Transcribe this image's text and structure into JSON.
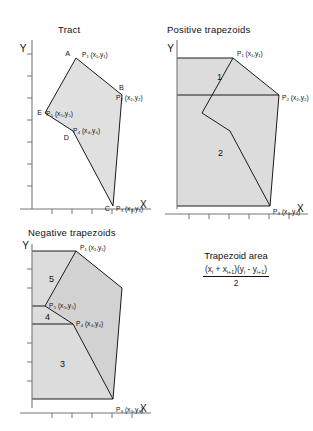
{
  "figure": {
    "background_color": "#ffffff",
    "line_color": "#1a1a1a",
    "fill_light": "#e3e3e3",
    "fill_mid": "#d8d8d8"
  },
  "panels": {
    "tract": {
      "title": "Tract",
      "axis_y": "Y",
      "axis_x": "X",
      "vertices": [
        {
          "letter": "A",
          "label": "P",
          "sub": "1",
          "coords": "(x₁,y₁)"
        },
        {
          "letter": "B",
          "label": "P",
          "sub": "2",
          "coords": "(x₂,y₂)"
        },
        {
          "letter": "C",
          "label": "P",
          "sub": "3",
          "coords": "(x₃,y₃)"
        },
        {
          "letter": "D",
          "label": "P",
          "sub": "4",
          "coords": "(x₄,y₄)"
        },
        {
          "letter": "E",
          "label": "P",
          "sub": "5",
          "coords": "(x₅,y₅)"
        }
      ],
      "point_labels": {
        "p1": "P₁ (x₁,y₁)",
        "p2": "P₂ (x₂,y₂)",
        "p3": "P₃ (x₃,y₃)",
        "p4": "P₄ (x₄,y₄)",
        "p5": "P₅ (x₅,y₅)"
      },
      "corner_letters": {
        "a": "A",
        "b": "B",
        "c": "C",
        "d": "D",
        "e": "E"
      }
    },
    "positive": {
      "title": "Positive trapezoids",
      "axis_y": "Y",
      "axis_x": "X",
      "region_labels": [
        "1",
        "2"
      ],
      "point_labels": {
        "p1": "P₁ (x₁,y₁)",
        "p2": "P₂ (x₂,y₂)",
        "p3": "P₃ (x₃,y₃)"
      }
    },
    "negative": {
      "title": "Negative trapezoids",
      "axis_y": "Y",
      "axis_x": "X",
      "region_labels": [
        "5",
        "4",
        "3"
      ],
      "point_labels": {
        "p1": "P₁ (x₁,y₁)",
        "p3": "P₃ (x₃,y₃)",
        "p4": "P₄ (x₄,y₄)",
        "p5": "P₅ (x₅,y₅)"
      }
    },
    "formula": {
      "title": "Trapezoid area",
      "numerator_plain": "(xᵢ + xᵢ₊₁)(yᵢ - yᵢ₊₁)",
      "denominator": "2",
      "numerator_parts": {
        "open1": "(x",
        "sub1": "i",
        "plus": " + x",
        "sub2": "i+1",
        "close1": ")(y",
        "sub3": "i",
        "minus": " - y",
        "sub4": "i+1",
        "close2": ")"
      }
    }
  }
}
